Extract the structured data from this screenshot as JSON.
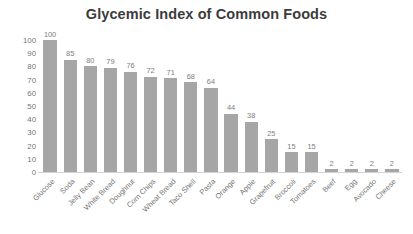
{
  "chart_data": {
    "type": "bar",
    "title": "Glycemic Index of Common Foods",
    "xlabel": "",
    "ylabel": "",
    "ylim": [
      0,
      100
    ],
    "ytick_step": 10,
    "yticks": [
      100,
      90,
      80,
      70,
      60,
      50,
      40,
      30,
      20,
      10,
      0
    ],
    "grid": false,
    "legend": false,
    "legend_position": "none",
    "data_labels": true,
    "bar_color": "#a6a6a6",
    "title_color": "#3c3c3c",
    "tick_color": "#767676",
    "label_rotation": -45,
    "categories": [
      "Glucose",
      "Soda",
      "Jelly Bean",
      "White Bread",
      "Doughnut",
      "Corn Chips",
      "Wheat Bread",
      "Taco Shell",
      "Pasta",
      "Orange",
      "Apple",
      "Grapefruit",
      "Broccoli",
      "Tomatoes",
      "Beef",
      "Egg",
      "Avocado",
      "Cheese"
    ],
    "values": [
      100,
      85,
      80,
      79,
      76,
      72,
      71,
      68,
      64,
      44,
      38,
      25,
      15,
      15,
      2,
      2,
      2,
      2
    ]
  }
}
